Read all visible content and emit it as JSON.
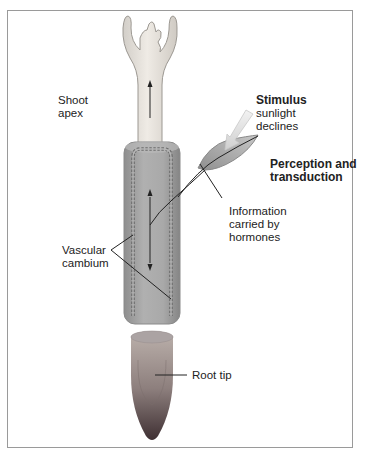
{
  "labels": {
    "shoot_apex": [
      "Shoot",
      "apex"
    ],
    "stimulus_title": "Stimulus",
    "stimulus_desc": [
      "sunlight",
      "declines"
    ],
    "perception": [
      "Perception and",
      "transduction"
    ],
    "information": [
      "Information",
      "carried by",
      "hormones"
    ],
    "vascular": [
      "Vascular",
      "cambium"
    ],
    "root_tip": "Root tip"
  },
  "colors": {
    "frame": "#9a9a9a",
    "shoot_fill": "#e7e3dc",
    "stem_fill": "#a8a8a8",
    "leaf_fill": "#b4b4b4",
    "stimulus_arrow": "#e0e0e0",
    "root_top": "#b0a7a2",
    "root_bottom": "#4a3a3c",
    "text": "#222222"
  }
}
